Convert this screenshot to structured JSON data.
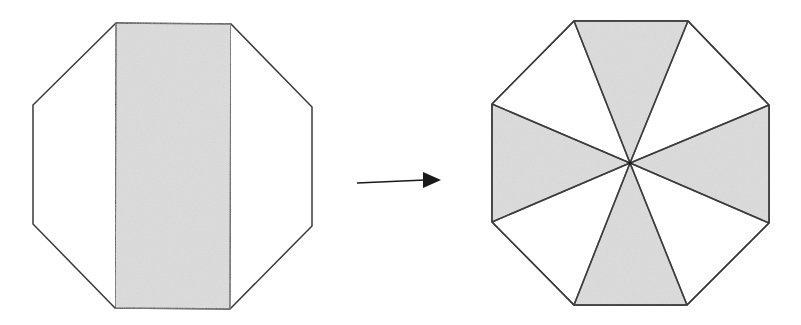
{
  "diagram": {
    "description": "Octagon dissection: a central vertical strip of a regular octagon is rearranged into four alternating triangular sectors meeting at the center",
    "colors": {
      "stroke": "#3a3a3a",
      "shaded_fill": "#d6d6d6",
      "unshaded_fill": "#ffffff",
      "arrow": "#1a1a1a"
    },
    "left_figure": {
      "label": "octagon-with-central-strip",
      "octagon_vertices": [
        [
          116,
          23
        ],
        [
          231,
          24
        ],
        [
          312,
          107
        ],
        [
          312,
          226
        ],
        [
          230,
          309
        ],
        [
          115,
          308
        ],
        [
          33,
          224
        ],
        [
          33,
          105
        ]
      ],
      "shaded_strip": [
        [
          116,
          23
        ],
        [
          231,
          24
        ],
        [
          230,
          309
        ],
        [
          115,
          308
        ]
      ]
    },
    "arrow": {
      "from": [
        357,
        183
      ],
      "to": [
        441,
        180
      ],
      "head": [
        [
          423,
          172
        ],
        [
          441,
          180
        ],
        [
          423,
          188
        ]
      ]
    },
    "right_figure": {
      "label": "octagon-with-four-shaded-sectors",
      "center": [
        630,
        163
      ],
      "octagon_vertices": [
        [
          574,
          21
        ],
        [
          688,
          21
        ],
        [
          769,
          105
        ],
        [
          769,
          223
        ],
        [
          687,
          305
        ],
        [
          574,
          305
        ],
        [
          492,
          222
        ],
        [
          492,
          104
        ]
      ],
      "shaded_sectors": [
        {
          "name": "top",
          "points": [
            [
              574,
              21
            ],
            [
              688,
              21
            ],
            [
              630,
              163
            ]
          ]
        },
        {
          "name": "right",
          "points": [
            [
              769,
              105
            ],
            [
              769,
              223
            ],
            [
              630,
              163
            ]
          ]
        },
        {
          "name": "bottom",
          "points": [
            [
              687,
              305
            ],
            [
              574,
              305
            ],
            [
              630,
              163
            ]
          ]
        },
        {
          "name": "left",
          "points": [
            [
              492,
              222
            ],
            [
              492,
              104
            ],
            [
              630,
              163
            ]
          ]
        }
      ]
    }
  }
}
